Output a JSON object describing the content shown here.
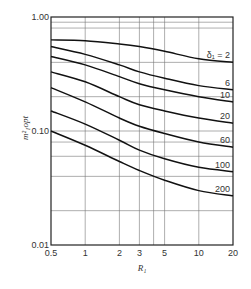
{
  "chart_data": {
    "type": "line",
    "title": "",
    "xlabel": "R₁",
    "ylabel": "m²₁opt",
    "xscale": "log",
    "yscale": "log",
    "xlim": [
      0.5,
      20
    ],
    "ylim": [
      0.01,
      1.0
    ],
    "x_ticks": [
      0.5,
      1,
      2,
      3,
      5,
      10,
      20
    ],
    "x_tick_labels": [
      "0.5",
      "1",
      "2",
      "3",
      "5",
      "10",
      "20"
    ],
    "y_ticks": [
      0.01,
      0.1,
      1.0
    ],
    "y_tick_labels": [
      "0.01",
      "0.10",
      "1.00"
    ],
    "x_grid": [
      1,
      2,
      3,
      4,
      5,
      10
    ],
    "y_grid": [
      0.9,
      0.8,
      0.4,
      0.2,
      0.1,
      0.08,
      0.06,
      0.04,
      0.02
    ],
    "grid": true,
    "legend": "inline labels at right end of curves",
    "x": [
      0.5,
      1,
      2,
      3,
      5,
      10,
      20
    ],
    "series": [
      {
        "name": "δ₁ = 2",
        "label": "δ₁ = 2",
        "values": [
          0.63,
          0.62,
          0.58,
          0.55,
          0.5,
          0.43,
          0.4
        ]
      },
      {
        "name": "6",
        "label": "6",
        "values": [
          0.55,
          0.47,
          0.38,
          0.33,
          0.29,
          0.25,
          0.23
        ]
      },
      {
        "name": "10",
        "label": "10",
        "values": [
          0.45,
          0.38,
          0.3,
          0.26,
          0.23,
          0.2,
          0.18
        ]
      },
      {
        "name": "20",
        "label": "20",
        "values": [
          0.33,
          0.27,
          0.2,
          0.17,
          0.15,
          0.13,
          0.117
        ]
      },
      {
        "name": "60",
        "label": "60",
        "values": [
          0.24,
          0.18,
          0.13,
          0.11,
          0.095,
          0.08,
          0.072
        ]
      },
      {
        "name": "100",
        "label": "100",
        "values": [
          0.15,
          0.115,
          0.083,
          0.068,
          0.057,
          0.048,
          0.044
        ]
      },
      {
        "name": "200",
        "label": "200",
        "values": [
          0.1,
          0.075,
          0.054,
          0.045,
          0.037,
          0.03,
          0.027
        ]
      }
    ]
  }
}
